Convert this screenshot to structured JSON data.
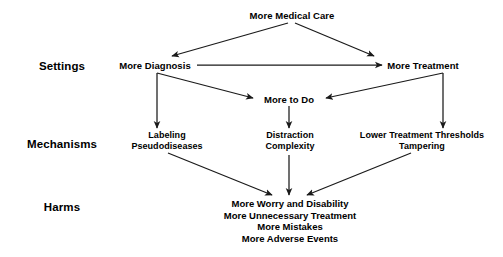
{
  "figure": {
    "background_color": "#ffffff",
    "text_color": "#000000",
    "arrow_color": "#1a1a1a"
  },
  "row_labels": [
    {
      "id": "settings",
      "label": "Settings"
    },
    {
      "id": "mechanisms",
      "label": "Mechanisms"
    },
    {
      "id": "harms",
      "label": "Harms"
    }
  ],
  "nodes": {
    "top": {
      "label": "More Medical Care"
    },
    "settings_left": {
      "label": "More Diagnosis"
    },
    "settings_right": {
      "label": "More Treatment"
    },
    "more_to_do": {
      "label": "More to Do"
    },
    "mechanism_left": {
      "line1": "Labeling",
      "line2": "Pseudodiseases"
    },
    "mechanism_center": {
      "line1": "Distraction",
      "line2": "Complexity"
    },
    "mechanism_right": {
      "line1": "Lower Treatment Thresholds",
      "line2": "Tampering"
    }
  },
  "harms": {
    "items": [
      "More Worry and Disability",
      "More Unnecessary Treatment",
      "More Mistakes",
      "More Adverse Events"
    ]
  },
  "edges": [
    {
      "id": "top-to-diagnosis",
      "from": "More Medical Care",
      "to": "More Diagnosis"
    },
    {
      "id": "top-to-treatment",
      "from": "More Medical Care",
      "to": "More Treatment"
    },
    {
      "id": "diagnosis-to-treatment",
      "from": "More Diagnosis",
      "to": "More Treatment"
    },
    {
      "id": "diagnosis-to-moretodo",
      "from": "More Diagnosis",
      "to": "More to Do"
    },
    {
      "id": "treatment-to-moretodo",
      "from": "More Treatment",
      "to": "More to Do"
    },
    {
      "id": "diagnosis-to-labeling",
      "from": "More Diagnosis",
      "to": "Labeling Pseudodiseases"
    },
    {
      "id": "treatment-to-thresholds",
      "from": "More Treatment",
      "to": "Lower Treatment Thresholds Tampering"
    },
    {
      "id": "moretodo-to-distraction",
      "from": "More to Do",
      "to": "Distraction Complexity"
    },
    {
      "id": "labeling-to-harms",
      "from": "Labeling Pseudodiseases",
      "to": "Harms"
    },
    {
      "id": "distraction-to-harms",
      "from": "Distraction Complexity",
      "to": "Harms"
    },
    {
      "id": "thresholds-to-harms",
      "from": "Lower Treatment Thresholds Tampering",
      "to": "Harms"
    }
  ]
}
